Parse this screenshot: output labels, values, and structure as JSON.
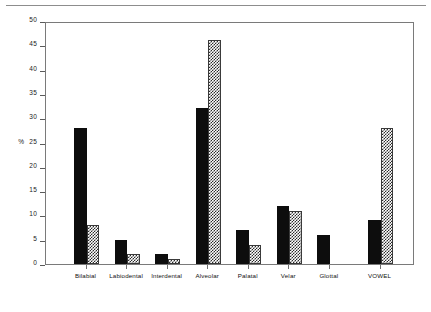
{
  "chart_data": {
    "type": "bar",
    "title": "",
    "subtitle": "",
    "xlabel": "",
    "ylabel": "%",
    "ylim": [
      0,
      50
    ],
    "ytick_interval": 5,
    "yticks": [
      0,
      5,
      10,
      15,
      20,
      25,
      30,
      35,
      40,
      45,
      50
    ],
    "ytick_labels": [
      "0",
      "5",
      "10",
      "15",
      "20",
      "25",
      "30",
      "35",
      "40",
      "45",
      "50"
    ],
    "axis_unit_label": "%",
    "axis_unit_at_tick": "25",
    "grid": false,
    "legend": false,
    "legend_position": "none",
    "categories": [
      "Bilabial",
      "Labiodental",
      "Interdental",
      "Alveolar",
      "Palatal",
      "Velar",
      "Glottal",
      "VOWEL"
    ],
    "series": [
      {
        "name": "series-1",
        "fill": "solid-black",
        "color": "#0d0d0d",
        "values": [
          28,
          5,
          2,
          32,
          7,
          12,
          6,
          9
        ]
      },
      {
        "name": "series-2",
        "fill": "checkered-hatch",
        "color": "#2b2b2b",
        "values": [
          8,
          2,
          1,
          46,
          4,
          11,
          0,
          28
        ]
      }
    ]
  },
  "colors": {
    "series_1": "#0d0d0d",
    "series_2": "#2b2b2b",
    "frame": "#7a7a7a",
    "axis": "#5a5a5a",
    "text": "#111111",
    "background": "#ffffff"
  }
}
